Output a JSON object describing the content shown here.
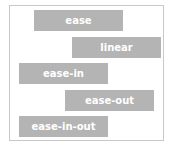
{
  "bars": [
    {
      "label": "ease",
      "x": 34,
      "y": 10
    },
    {
      "label": "linear",
      "x": 72,
      "y": 37
    },
    {
      "label": "ease-in",
      "x": 19,
      "y": 63
    },
    {
      "label": "ease-out",
      "x": 65,
      "y": 90
    },
    {
      "label": "ease-in-out",
      "x": 19,
      "y": 116
    }
  ],
  "colors": {
    "bar": "#b4b4b4",
    "text": "#ffffff",
    "border": "#c8c8c8"
  }
}
